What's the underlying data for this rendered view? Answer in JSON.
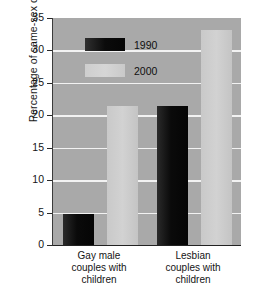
{
  "chart_data": {
    "type": "bar",
    "title": "",
    "xlabel": "",
    "ylabel": "Percentage of same-sex couples",
    "categories": [
      "Gay male couples with children",
      "Lesbian couples with children"
    ],
    "category_lines": [
      [
        "Gay male",
        "couples with",
        "children"
      ],
      [
        "Lesbian",
        "couples with",
        "children"
      ]
    ],
    "series": [
      {
        "name": "1990",
        "color": "#0a0a0a",
        "values": [
          4.8,
          21.4
        ]
      },
      {
        "name": "2000",
        "color": "#cccccc",
        "values": [
          21.4,
          33.2
        ]
      }
    ],
    "ylim": [
      0,
      35
    ],
    "ytick_step": 5,
    "yticks": [
      "0",
      "5",
      "10",
      "15",
      "20",
      "25",
      "30",
      "35"
    ],
    "grid": true,
    "grid_color": "#f2f2f2",
    "legend_position": "top-left-inside",
    "plot_background": "#a9a9a9"
  },
  "legend": {
    "items": [
      {
        "label": "1990"
      },
      {
        "label": "2000"
      }
    ]
  }
}
